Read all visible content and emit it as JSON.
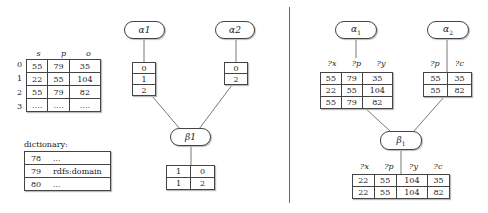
{
  "left": {
    "triple_table": {
      "headers": [
        "s",
        "p",
        "o"
      ],
      "row_indices": [
        "0",
        "1",
        "2",
        "3"
      ],
      "rows": [
        [
          "55",
          "79",
          "35"
        ],
        [
          "22",
          "55",
          "104"
        ],
        [
          "55",
          "79",
          "82"
        ],
        [
          "....",
          "....",
          "...."
        ]
      ]
    },
    "dictionary": {
      "label": "dictionary:",
      "rows": [
        {
          "id": "78",
          "value": "..."
        },
        {
          "id": "79",
          "value": "rdfs:domain"
        },
        {
          "id": "80",
          "value": "..."
        }
      ]
    },
    "nodes": {
      "alpha1": {
        "label": "α1",
        "rows": [
          "0",
          "1",
          "2"
        ]
      },
      "alpha2": {
        "label": "α2",
        "rows": [
          "0",
          "2"
        ]
      },
      "beta1": {
        "label": "β1",
        "rows": [
          [
            "1",
            "0"
          ],
          [
            "1",
            "2"
          ]
        ]
      }
    }
  },
  "right": {
    "nodes": {
      "alpha1": {
        "label": "α",
        "sub": "1",
        "headers": [
          "?x",
          "?p",
          "?y"
        ],
        "rows": [
          [
            "55",
            "79",
            "35"
          ],
          [
            "22",
            "55",
            "104"
          ],
          [
            "55",
            "79",
            "82"
          ]
        ]
      },
      "alpha2": {
        "label": "α",
        "sub": "2",
        "headers": [
          "?p",
          "?c"
        ],
        "rows": [
          [
            "55",
            "35"
          ],
          [
            "55",
            "82"
          ]
        ]
      },
      "beta1": {
        "label": "β",
        "sub": "1",
        "headers": [
          "?x",
          "?p",
          "?y",
          "?c"
        ],
        "rows": [
          [
            "22",
            "55",
            "104",
            "35"
          ],
          [
            "22",
            "55",
            "104",
            "82"
          ]
        ]
      }
    }
  },
  "colors": {
    "stroke": "#444444",
    "divider": "#666666"
  }
}
